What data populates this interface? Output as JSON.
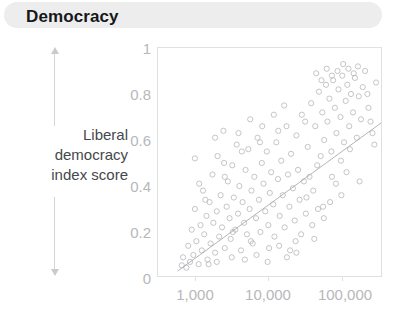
{
  "banner": {
    "title": "Democracy",
    "background_color": "#ededed"
  },
  "axis_caption": {
    "line1": "Liberal",
    "line2": "democracy",
    "line3": "index score",
    "arrow_up_icon": "arrow-up-icon",
    "arrow_down_icon": "arrow-down-icon"
  },
  "chart_data": {
    "type": "scatter",
    "title": "Democracy",
    "xlabel": "",
    "ylabel": "Liberal democracy index score",
    "x_scale": "log",
    "xlim": [
      400,
      250000
    ],
    "ylim": [
      0,
      1
    ],
    "grid": false,
    "legend": null,
    "x_ticks": [
      "1,000",
      "10,000",
      "100,000"
    ],
    "x_tick_values": [
      1000,
      10000,
      100000
    ],
    "y_ticks": [
      "0",
      "0.2",
      "0.4",
      "0.6",
      "0.8",
      "1"
    ],
    "y_tick_values": [
      0,
      0.2,
      0.4,
      0.6,
      0.8,
      1
    ],
    "marker": "open-circle",
    "marker_color": "#b9bbbe",
    "trendline": {
      "type": "linear-on-log-x",
      "color": "#a9abae",
      "x_start": 700,
      "y_start": 0.03,
      "x_end": 250000,
      "y_end": 0.68
    },
    "series": [
      {
        "name": "Countries",
        "points": [
          [
            790,
            0.055
          ],
          [
            820,
            0.09
          ],
          [
            900,
            0.045
          ],
          [
            950,
            0.14
          ],
          [
            1000,
            0.07
          ],
          [
            1050,
            0.21
          ],
          [
            1100,
            0.1
          ],
          [
            1150,
            0.3
          ],
          [
            1200,
            0.16
          ],
          [
            1280,
            0.06
          ],
          [
            1350,
            0.23
          ],
          [
            1400,
            0.12
          ],
          [
            1450,
            0.38
          ],
          [
            1500,
            0.19
          ],
          [
            1600,
            0.27
          ],
          [
            1650,
            0.08
          ],
          [
            1750,
            0.33
          ],
          [
            1800,
            0.15
          ],
          [
            1900,
            0.45
          ],
          [
            1950,
            0.24
          ],
          [
            2050,
            0.11
          ],
          [
            2150,
            0.29
          ],
          [
            2200,
            0.53
          ],
          [
            2300,
            0.18
          ],
          [
            2400,
            0.36
          ],
          [
            2500,
            0.22
          ],
          [
            2600,
            0.64
          ],
          [
            2700,
            0.13
          ],
          [
            2850,
            0.31
          ],
          [
            2950,
            0.42
          ],
          [
            3100,
            0.26
          ],
          [
            3200,
            0.17
          ],
          [
            3350,
            0.49
          ],
          [
            3500,
            0.35
          ],
          [
            3650,
            0.21
          ],
          [
            3800,
            0.58
          ],
          [
            3950,
            0.28
          ],
          [
            4100,
            0.4
          ],
          [
            4300,
            0.12
          ],
          [
            4500,
            0.33
          ],
          [
            4700,
            0.24
          ],
          [
            4900,
            0.47
          ],
          [
            5100,
            0.19
          ],
          [
            5300,
            0.56
          ],
          [
            5500,
            0.3
          ],
          [
            5800,
            0.38
          ],
          [
            6000,
            0.15
          ],
          [
            6300,
            0.44
          ],
          [
            6600,
            0.26
          ],
          [
            6900,
            0.61
          ],
          [
            7200,
            0.34
          ],
          [
            7500,
            0.2
          ],
          [
            7800,
            0.5
          ],
          [
            8200,
            0.41
          ],
          [
            8600,
            0.29
          ],
          [
            9000,
            0.55
          ],
          [
            9400,
            0.23
          ],
          [
            9800,
            0.37
          ],
          [
            10200,
            0.46
          ],
          [
            10800,
            0.32
          ],
          [
            11200,
            0.18
          ],
          [
            11800,
            0.59
          ],
          [
            12400,
            0.43
          ],
          [
            13000,
            0.27
          ],
          [
            13600,
            0.51
          ],
          [
            14200,
            0.36
          ],
          [
            15000,
            0.22
          ],
          [
            15800,
            0.66
          ],
          [
            16500,
            0.45
          ],
          [
            17200,
            0.31
          ],
          [
            18000,
            0.54
          ],
          [
            19000,
            0.39
          ],
          [
            20000,
            0.25
          ],
          [
            21000,
            0.62
          ],
          [
            22000,
            0.47
          ],
          [
            23000,
            0.34
          ],
          [
            24500,
            0.71
          ],
          [
            26000,
            0.42
          ],
          [
            27500,
            0.28
          ],
          [
            29000,
            0.57
          ],
          [
            30500,
            0.44
          ],
          [
            32000,
            0.76
          ],
          [
            34000,
            0.38
          ],
          [
            36000,
            0.66
          ],
          [
            38000,
            0.49
          ],
          [
            40000,
            0.81
          ],
          [
            42000,
            0.53
          ],
          [
            44000,
            0.72
          ],
          [
            46500,
            0.6
          ],
          [
            49000,
            0.84
          ],
          [
            51000,
            0.68
          ],
          [
            54000,
            0.78
          ],
          [
            57000,
            0.55
          ],
          [
            60000,
            0.86
          ],
          [
            63000,
            0.74
          ],
          [
            66000,
            0.63
          ],
          [
            70000,
            0.82
          ],
          [
            74000,
            0.7
          ],
          [
            78000,
            0.88
          ],
          [
            82000,
            0.59
          ],
          [
            86000,
            0.77
          ],
          [
            90000,
            0.84
          ],
          [
            95000,
            0.66
          ],
          [
            100000,
            0.8
          ],
          [
            106000,
            0.72
          ],
          [
            112000,
            0.87
          ],
          [
            118000,
            0.61
          ],
          [
            125000,
            0.79
          ],
          [
            133000,
            0.69
          ],
          [
            140000,
            0.83
          ],
          [
            1300,
            0.41
          ],
          [
            1700,
            0.06
          ],
          [
            2150,
            0.07
          ],
          [
            2700,
            0.44
          ],
          [
            3300,
            0.09
          ],
          [
            4000,
            0.63
          ],
          [
            4800,
            0.08
          ],
          [
            5600,
            0.69
          ],
          [
            6700,
            0.1
          ],
          [
            7900,
            0.66
          ],
          [
            9200,
            0.07
          ],
          [
            11000,
            0.71
          ],
          [
            12800,
            0.14
          ],
          [
            14800,
            0.75
          ],
          [
            17500,
            0.12
          ],
          [
            20500,
            0.16
          ],
          [
            24000,
            0.19
          ],
          [
            28000,
            0.35
          ],
          [
            33000,
            0.23
          ],
          [
            39000,
            0.3
          ],
          [
            46000,
            0.26
          ],
          [
            55000,
            0.33
          ],
          [
            65000,
            0.41
          ],
          [
            76000,
            0.36
          ],
          [
            88000,
            0.46
          ],
          [
            1150,
            0.52
          ],
          [
            1550,
            0.34
          ],
          [
            2050,
            0.61
          ],
          [
            2650,
            0.5
          ],
          [
            3400,
            0.2
          ],
          [
            4400,
            0.55
          ],
          [
            5700,
            0.16
          ],
          [
            7400,
            0.59
          ],
          [
            9600,
            0.13
          ],
          [
            12500,
            0.64
          ],
          [
            16000,
            0.09
          ],
          [
            21000,
            0.11
          ],
          [
            27000,
            0.68
          ],
          [
            35000,
            0.17
          ],
          [
            45000,
            0.31
          ],
          [
            58000,
            0.44
          ],
          [
            75000,
            0.51
          ],
          [
            97000,
            0.56
          ],
          [
            128000,
            0.42
          ],
          [
            165000,
            0.74
          ],
          [
            185000,
            0.63
          ],
          [
            205000,
            0.85
          ],
          [
            150000,
            0.9
          ],
          [
            122000,
            0.92
          ],
          [
            108000,
            0.89
          ],
          [
            93000,
            0.91
          ],
          [
            80000,
            0.93
          ],
          [
            68000,
            0.9
          ],
          [
            58000,
            0.88
          ],
          [
            50000,
            0.91
          ],
          [
            43000,
            0.86
          ],
          [
            37000,
            0.89
          ],
          [
            160000,
            0.8
          ],
          [
            175000,
            0.68
          ],
          [
            195000,
            0.58
          ]
        ]
      }
    ]
  }
}
